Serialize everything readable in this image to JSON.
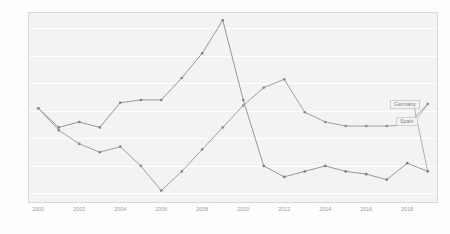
{
  "chart_data": {
    "type": "line",
    "title": "",
    "subtitle": "",
    "xlabel": "",
    "ylabel": "",
    "xlim": [
      1999.5,
      2019.5
    ],
    "ylim": [
      -0.35,
      6.6
    ],
    "grid": true,
    "legend_position": "inline-right",
    "x": [
      2000,
      2001,
      2002,
      2003,
      2004,
      2005,
      2006,
      2007,
      2008,
      2009,
      2010,
      2011,
      2012,
      2013,
      2014,
      2015,
      2016,
      2017,
      2018,
      2019
    ],
    "xtick_labels": [
      "2000",
      "2002",
      "2004",
      "2006",
      "2008",
      "2010",
      "2012",
      "2014",
      "2016",
      "2018"
    ],
    "xticks": [
      2000,
      2002,
      2004,
      2006,
      2008,
      2010,
      2012,
      2014,
      2016,
      2018
    ],
    "ytick_labels": [
      "0",
      "1",
      "2",
      "3",
      "4",
      "5",
      "6"
    ],
    "yticks": [
      0,
      1,
      2,
      3,
      4,
      5,
      6
    ],
    "series": [
      {
        "name": "Germany",
        "color": "#7f7f7f",
        "values": [
          3.1,
          2.4,
          2.6,
          2.4,
          3.3,
          3.4,
          3.4,
          4.2,
          5.1,
          6.3,
          3.4,
          1.0,
          0.6,
          0.8,
          1.0,
          0.8,
          0.7,
          0.5,
          1.1,
          0.8
        ]
      },
      {
        "name": "Spain",
        "color": "#8a8a8a",
        "values": [
          3.1,
          2.3,
          1.8,
          1.5,
          1.7,
          1.0,
          0.1,
          0.8,
          1.6,
          2.4,
          3.2,
          3.85,
          4.15,
          2.95,
          2.6,
          2.45,
          2.45,
          2.45,
          2.5,
          3.25
        ]
      }
    ],
    "legend": [
      {
        "label": "Germany"
      },
      {
        "label": "Spain"
      }
    ]
  }
}
